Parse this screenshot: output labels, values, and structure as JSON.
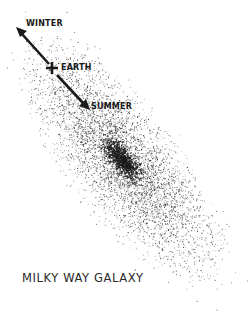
{
  "diagram": {
    "title": "MILKY WAY GALAXY",
    "labels": {
      "winter": "WINTER",
      "earth": "EARTH",
      "summer": "SUMMER"
    },
    "icons": {
      "earth_marker": "cross-icon",
      "winter_arrow": "arrow-up-left-icon",
      "summer_arrow": "arrow-down-right-icon"
    },
    "colors": {
      "ink": "#1a1a1a",
      "background": "#ffffff"
    },
    "galaxy": {
      "shape": "tilted spiral disk of stippled stars",
      "core_position": [
        122,
        160
      ],
      "orientation_deg": 52
    },
    "earth_position": [
      52,
      68
    ],
    "winter_direction_tip": [
      17,
      29
    ],
    "summer_direction_tip": [
      88,
      108
    ]
  }
}
